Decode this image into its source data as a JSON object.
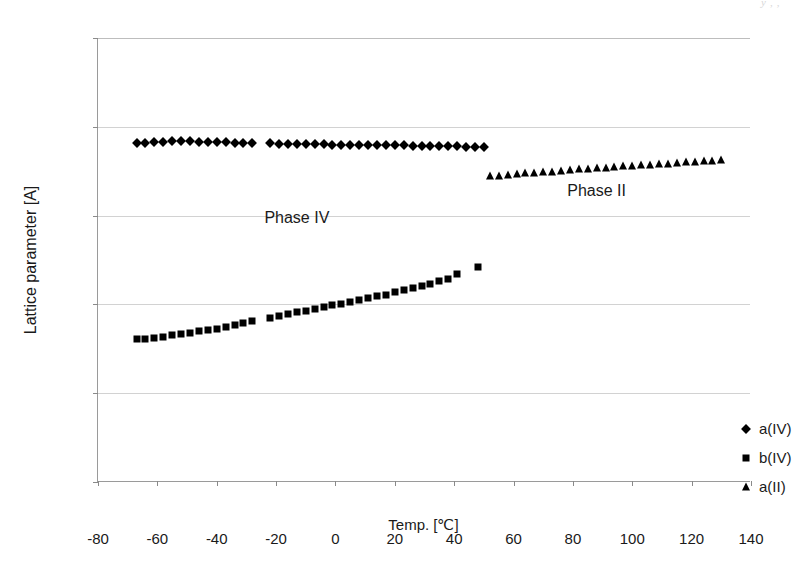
{
  "page": {
    "header_remnant": "y                    ,  ,"
  },
  "chart_data": {
    "type": "scatter",
    "title": "",
    "xlabel": "Temp. [℃]",
    "ylabel": "Lattice parameter [A]",
    "xlim": [
      -80,
      140
    ],
    "ylim": [
      5,
      6
    ],
    "xticks": [
      -80,
      -60,
      -40,
      -20,
      0,
      20,
      40,
      60,
      80,
      100,
      120,
      140
    ],
    "xtick_labels": [
      "-80",
      "-60",
      "-40",
      "-20",
      "0",
      "20",
      "40",
      "60",
      "80",
      "100",
      "120",
      "140"
    ],
    "yticks": [
      5,
      5.2,
      5.4,
      5.6,
      5.8,
      6
    ],
    "ytick_labels": [
      "5",
      "5,2",
      "5,4",
      "5,6",
      "5,8",
      "6"
    ],
    "grid": "horizontal",
    "legend_position": "inside-right-lower",
    "marker_color": "#000000",
    "gridline_color": "#d2d2d2",
    "axis_color": "#9a9a9a",
    "annotations": [
      {
        "text": "Phase IV",
        "x": -13,
        "y": 5.595
      },
      {
        "text": "Phase II",
        "x": 88,
        "y": 5.655
      }
    ],
    "legend": [
      {
        "name": "a(IV)",
        "marker": "diamond"
      },
      {
        "name": "b(IV)",
        "marker": "square"
      },
      {
        "name": "a(II)",
        "marker": "triangle"
      }
    ],
    "series": [
      {
        "name": "a(IV)",
        "marker": "diamond",
        "points": [
          [
            -67,
            5.763
          ],
          [
            -64,
            5.764
          ],
          [
            -61,
            5.765
          ],
          [
            -58,
            5.766
          ],
          [
            -55,
            5.767
          ],
          [
            -52,
            5.768
          ],
          [
            -49,
            5.768
          ],
          [
            -46,
            5.766
          ],
          [
            -43,
            5.765
          ],
          [
            -40,
            5.765
          ],
          [
            -37,
            5.765
          ],
          [
            -34,
            5.764
          ],
          [
            -31,
            5.764
          ],
          [
            -28,
            5.763
          ],
          [
            -22,
            5.763
          ],
          [
            -19,
            5.762
          ],
          [
            -16,
            5.762
          ],
          [
            -13,
            5.762
          ],
          [
            -10,
            5.761
          ],
          [
            -7,
            5.761
          ],
          [
            -4,
            5.761
          ],
          [
            -1,
            5.76
          ],
          [
            2,
            5.76
          ],
          [
            5,
            5.76
          ],
          [
            8,
            5.759
          ],
          [
            11,
            5.759
          ],
          [
            14,
            5.759
          ],
          [
            17,
            5.758
          ],
          [
            20,
            5.758
          ],
          [
            23,
            5.758
          ],
          [
            26,
            5.757
          ],
          [
            29,
            5.757
          ],
          [
            32,
            5.757
          ],
          [
            35,
            5.756
          ],
          [
            38,
            5.756
          ],
          [
            41,
            5.756
          ],
          [
            44,
            5.755
          ],
          [
            47,
            5.755
          ],
          [
            50,
            5.755
          ]
        ]
      },
      {
        "name": "b(IV)",
        "marker": "square",
        "points": [
          [
            -67,
            5.322
          ],
          [
            -64,
            5.323
          ],
          [
            -61,
            5.325
          ],
          [
            -58,
            5.327
          ],
          [
            -55,
            5.33
          ],
          [
            -52,
            5.333
          ],
          [
            -49,
            5.336
          ],
          [
            -46,
            5.339
          ],
          [
            -43,
            5.342
          ],
          [
            -40,
            5.345
          ],
          [
            -37,
            5.349
          ],
          [
            -34,
            5.353
          ],
          [
            -31,
            5.357
          ],
          [
            -28,
            5.362
          ],
          [
            -22,
            5.37
          ],
          [
            -19,
            5.374
          ],
          [
            -16,
            5.378
          ],
          [
            -13,
            5.382
          ],
          [
            -10,
            5.386
          ],
          [
            -7,
            5.39
          ],
          [
            -4,
            5.394
          ],
          [
            -1,
            5.398
          ],
          [
            2,
            5.402
          ],
          [
            5,
            5.406
          ],
          [
            8,
            5.41
          ],
          [
            11,
            5.414
          ],
          [
            14,
            5.418
          ],
          [
            17,
            5.422
          ],
          [
            20,
            5.427
          ],
          [
            23,
            5.432
          ],
          [
            26,
            5.437
          ],
          [
            29,
            5.442
          ],
          [
            32,
            5.447
          ],
          [
            35,
            5.452
          ],
          [
            38,
            5.458
          ],
          [
            41,
            5.468
          ],
          [
            48,
            5.485
          ]
        ]
      },
      {
        "name": "a(II)",
        "marker": "triangle",
        "points": [
          [
            52,
            5.689
          ],
          [
            55,
            5.69
          ],
          [
            58,
            5.692
          ],
          [
            61,
            5.693
          ],
          [
            64,
            5.695
          ],
          [
            67,
            5.696
          ],
          [
            70,
            5.698
          ],
          [
            73,
            5.699
          ],
          [
            76,
            5.701
          ],
          [
            79,
            5.702
          ],
          [
            82,
            5.704
          ],
          [
            85,
            5.705
          ],
          [
            88,
            5.707
          ],
          [
            91,
            5.708
          ],
          [
            94,
            5.709
          ],
          [
            97,
            5.711
          ],
          [
            100,
            5.712
          ],
          [
            103,
            5.713
          ],
          [
            106,
            5.715
          ],
          [
            109,
            5.716
          ],
          [
            112,
            5.717
          ],
          [
            115,
            5.719
          ],
          [
            118,
            5.72
          ],
          [
            121,
            5.721
          ],
          [
            124,
            5.722
          ],
          [
            127,
            5.723
          ],
          [
            130,
            5.725
          ]
        ]
      }
    ]
  }
}
